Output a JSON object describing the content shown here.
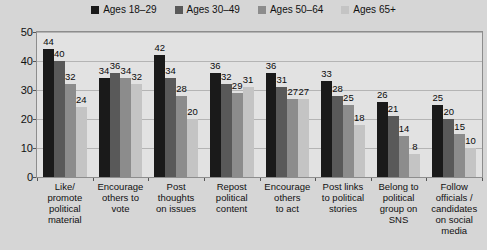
{
  "chart_data": {
    "type": "bar",
    "title": "",
    "xlabel": "",
    "ylabel": "Percentage",
    "ylim": [
      0,
      50
    ],
    "yticks": [
      0,
      10,
      20,
      30,
      40,
      50
    ],
    "grid": true,
    "legend_position": "top-center",
    "categories": [
      "Like/ promote political material",
      "Encourage others to vote",
      "Post thoughts on issues",
      "Repost political content",
      "Encourage others to act",
      "Post links to political stories",
      "Belong to political group on SNS",
      "Follow officials / candidates on social media"
    ],
    "category_lines": [
      [
        "Like/",
        "promote",
        "political",
        "material"
      ],
      [
        "Encourage",
        "others to",
        "vote"
      ],
      [
        "Post",
        "thoughts",
        "on issues"
      ],
      [
        "Repost",
        "political",
        "content"
      ],
      [
        "Encourage",
        "others",
        "to act"
      ],
      [
        "Post links",
        "to political",
        "stories"
      ],
      [
        "Belong to",
        "political",
        "group on",
        "SNS"
      ],
      [
        "Follow",
        "officials /",
        "candidates",
        "on social",
        "media"
      ]
    ],
    "series": [
      {
        "name": "Ages 18–29",
        "color": "#1a1a1a",
        "values": [
          44,
          34,
          42,
          36,
          36,
          33,
          26,
          25
        ]
      },
      {
        "name": "Ages 30–49",
        "color": "#595959",
        "values": [
          40,
          36,
          34,
          32,
          31,
          28,
          21,
          20
        ]
      },
      {
        "name": "Ages 50–64",
        "color": "#8c8c8c",
        "values": [
          32,
          34,
          28,
          29,
          27,
          25,
          14,
          15
        ]
      },
      {
        "name": "Ages 65+",
        "color": "#c4c4c4",
        "values": [
          24,
          32,
          20,
          31,
          27,
          18,
          8,
          10
        ]
      }
    ]
  },
  "legend": {
    "items": [
      {
        "label": "Ages 18–29",
        "color": "#1a1a1a"
      },
      {
        "label": "Ages 30–49",
        "color": "#595959"
      },
      {
        "label": "Ages 50–64",
        "color": "#8c8c8c"
      },
      {
        "label": "Ages 65+",
        "color": "#c4c4c4"
      }
    ]
  },
  "axes": {
    "y_title": "Percentage",
    "y_ticks": [
      "50",
      "40",
      "30",
      "20",
      "10",
      "0"
    ]
  }
}
